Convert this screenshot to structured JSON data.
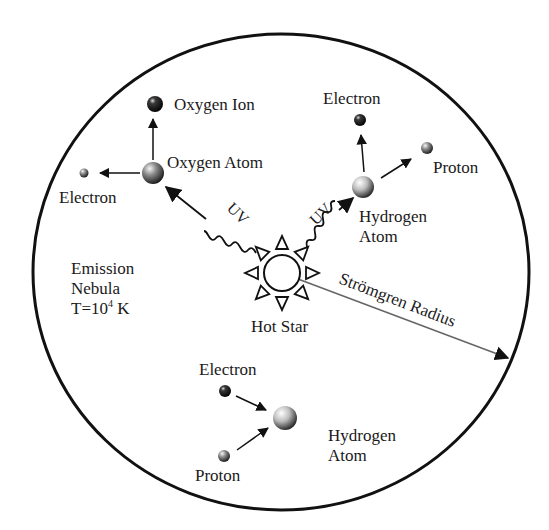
{
  "diagram": {
    "nebula": {
      "label_line1": "Emission",
      "label_line2": "Nebula",
      "temp_prefix": "T=10",
      "temp_exponent": "4",
      "temp_suffix": " K"
    },
    "star": {
      "label": "Hot Star"
    },
    "stromgren": {
      "label": "Strömgren Radius"
    },
    "uv": {
      "left_label": "UV",
      "right_label": "UV"
    },
    "oxygen_group": {
      "ion_label": "Oxygen Ion",
      "atom_label": "Oxygen Atom",
      "electron_label": "Electron"
    },
    "hydrogen_ionization_group": {
      "electron_label": "Electron",
      "proton_label": "Proton",
      "atom_label_line1": "Hydrogen",
      "atom_label_line2": "Atom"
    },
    "recombination_group": {
      "electron_label": "Electron",
      "proton_label": "Proton",
      "atom_label_line1": "Hydrogen",
      "atom_label_line2": "Atom"
    },
    "colors": {
      "stroke": "#111111",
      "radius_line": "#666666",
      "background": "#ffffff"
    }
  }
}
